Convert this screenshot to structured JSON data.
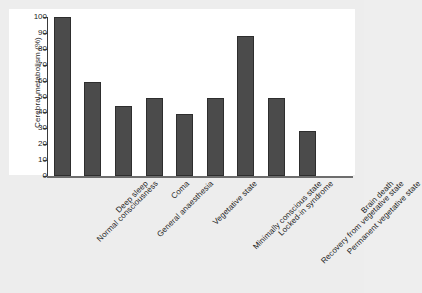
{
  "chart_data": {
    "type": "bar",
    "title": "",
    "subtitle": "",
    "xlabel": "",
    "ylabel": "Cerebral metabolism (%)",
    "ylim": [
      0,
      100
    ],
    "yticks": [
      0,
      10,
      20,
      30,
      40,
      50,
      60,
      70,
      80,
      90,
      100
    ],
    "ytick_labels": [
      "0",
      "10",
      "20",
      "30",
      "40",
      "50",
      "60",
      "70",
      "80",
      "90",
      "100"
    ],
    "grid": false,
    "legend": false,
    "legend_position": "none",
    "bar_color": "#4b4b4b",
    "bar_edge_color": "#2e2e2e",
    "background_color": "#ededed",
    "plot_background_color": "#ffffff",
    "axis_color": "#3a3a3a",
    "categories": [
      "Normal consciousness",
      "Deep sleep",
      "General anaesthesia",
      "Coma",
      "Vegetative state",
      "Minimally conscious state",
      "Locked-in syndrome",
      "Recovery from vegetative state",
      "Permanent vegetative state",
      "Brain death"
    ],
    "values": [
      100,
      59,
      44,
      49,
      39,
      49,
      88,
      49,
      28,
      0
    ]
  }
}
